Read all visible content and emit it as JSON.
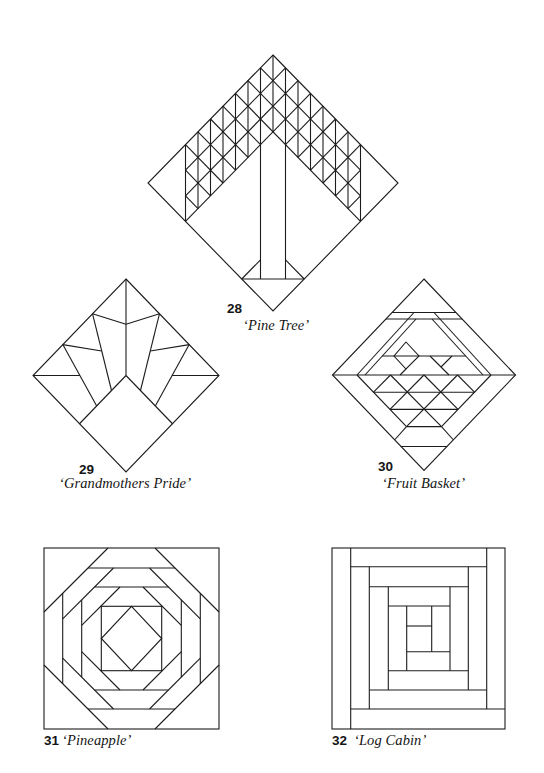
{
  "page": {
    "background": "#ffffff",
    "line_color": "#1c1c1c"
  },
  "figures": [
    {
      "number": "28",
      "name": "‘Pine Tree’"
    },
    {
      "number": "29",
      "name": "‘Grandmothers Pride’"
    },
    {
      "number": "30",
      "name": "‘Fruit Basket’"
    },
    {
      "number": "31",
      "name": "‘Pineapple’"
    },
    {
      "number": "32",
      "name": "‘Log Cabin’"
    }
  ]
}
